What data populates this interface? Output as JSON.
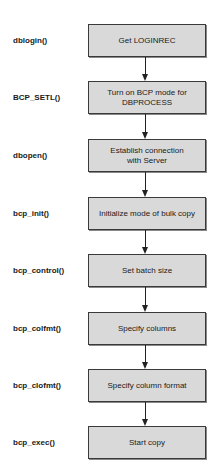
{
  "diagram": {
    "type": "flowchart",
    "direction": "top-to-bottom",
    "box_fill": "#d9d9d9",
    "box_border": "#3a3a3a",
    "steps": [
      {
        "function": "dblogin()",
        "action": "Get LOGINREC"
      },
      {
        "function": "BCP_SETL()",
        "action": "Turn on BCP mode for\nDBPROCESS"
      },
      {
        "function": "dbopen()",
        "action": "Establish connection\nwith Server"
      },
      {
        "function": "bcp_init()",
        "action": "Initialize mode of bulk copy"
      },
      {
        "function": "bcp_control()",
        "action": "Set batch size"
      },
      {
        "function": "bcp_colfmt()",
        "action": "Specify columns"
      },
      {
        "function": "bcp_clofmt()",
        "action": "Specify column  format"
      },
      {
        "function": "bcp_exec()",
        "action": "Start copy"
      }
    ]
  }
}
